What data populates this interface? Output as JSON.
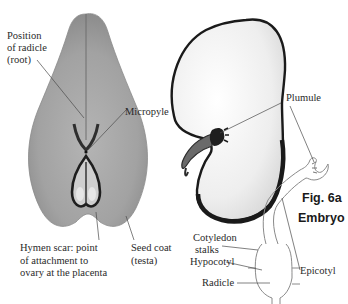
{
  "figure": {
    "number": "Fig. 6a",
    "title": "Embryo"
  },
  "labels": {
    "radicle_position": [
      "Position",
      "of radicle",
      "(root)"
    ],
    "micropyle": "Micropyle",
    "hymen_scar": [
      "Hymen scar: point",
      "of attachment to",
      "ovary at the placenta"
    ],
    "seed_coat": [
      "Seed coat",
      "(testa)"
    ],
    "plumule": "Plumule",
    "cotyledon_stalks": [
      "Cotyledon",
      "stalks"
    ],
    "hypocotyl": "Hypocotyl",
    "radicle": "Radicle",
    "epicotyl": "Epicotyl"
  },
  "colors": {
    "seed_fill": "#a8a8a8",
    "seed_dark": "#3a3a3a",
    "cotyledon_fill": "#f2f2f2",
    "cotyledon_edge": "#1c1c1c",
    "leader_line": "#555555",
    "text": "#2a2a2a"
  }
}
